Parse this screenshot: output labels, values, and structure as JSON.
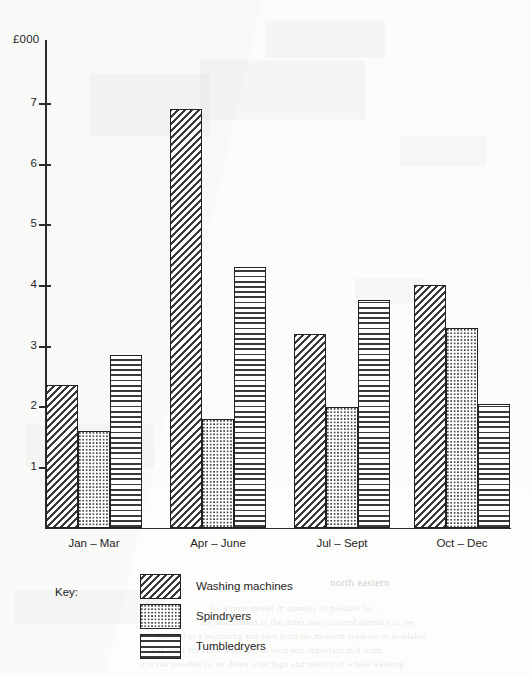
{
  "chart_data": {
    "type": "bar",
    "title": "",
    "subtitle": "",
    "xlabel": "",
    "ylabel": "£000",
    "ylim": [
      0,
      7.5
    ],
    "yticks": [
      1,
      2,
      3,
      4,
      5,
      6,
      7
    ],
    "ytick_labels": [
      "1",
      "2",
      "3",
      "4",
      "5",
      "6",
      "7"
    ],
    "grid": false,
    "legend_position": "below-left",
    "legend_title": "Key:",
    "categories": [
      "Jan – Mar",
      "Apr – June",
      "Jul – Sept",
      "Oct – Dec"
    ],
    "series": [
      {
        "name": "Washing machines",
        "pattern": "diagonal-hatch",
        "values": [
          2.35,
          6.9,
          3.2,
          4.0
        ]
      },
      {
        "name": "Spindryers",
        "pattern": "dotted-stipple",
        "values": [
          1.6,
          1.8,
          2.0,
          3.3
        ]
      },
      {
        "name": "Tumbledryers",
        "pattern": "horizontal-lines",
        "values": [
          2.85,
          4.3,
          3.75,
          2.05
        ]
      }
    ]
  },
  "axis": {
    "y_title": "£000",
    "ticks": [
      {
        "label": "7",
        "value": 7
      },
      {
        "label": "6",
        "value": 6
      },
      {
        "label": "5",
        "value": 5
      },
      {
        "label": "4",
        "value": 4
      },
      {
        "label": "3",
        "value": 3
      },
      {
        "label": "2",
        "value": 2
      },
      {
        "label": "1",
        "value": 1
      }
    ]
  },
  "x_labels": [
    {
      "label": "Jan – Mar"
    },
    {
      "label": "Apr – June"
    },
    {
      "label": "Jul – Sept"
    },
    {
      "label": "Oct – Dec"
    }
  ],
  "legend": {
    "title": "Key:",
    "items": [
      {
        "label": "Washing machines",
        "pattern": "diagonal-hatch"
      },
      {
        "label": "Spindryers",
        "pattern": "dotted-stipple"
      },
      {
        "label": "Tumbledryers",
        "pattern": "horizontal-lines"
      }
    ]
  },
  "colors": {
    "ink": "#222222",
    "paper": "#fdfdfc",
    "hatch": "#3a3a3a"
  },
  "bleed_through": [
    {
      "text": "north eastern",
      "x": 330,
      "y": 576
    },
    {
      "text": "for a time   spread in quantity  of  produce by  ...",
      "x": 210,
      "y": 603
    },
    {
      "text": "the   distribution of  the   index  has  occurred  quantity  of the",
      "x": 200,
      "y": 617
    },
    {
      "text": "national in  a  beginning  and  earn  from  the  moment  separate  or  available",
      "x": 155,
      "y": 631
    },
    {
      "text": "a   of  the   1  the   chief   receivers  of  food  and  important  in  it  from",
      "x": 150,
      "y": 645
    },
    {
      "text": "it   is  not  possible  to  set  down  what  high  and  nations  of  whole  washing",
      "x": 140,
      "y": 659
    }
  ]
}
